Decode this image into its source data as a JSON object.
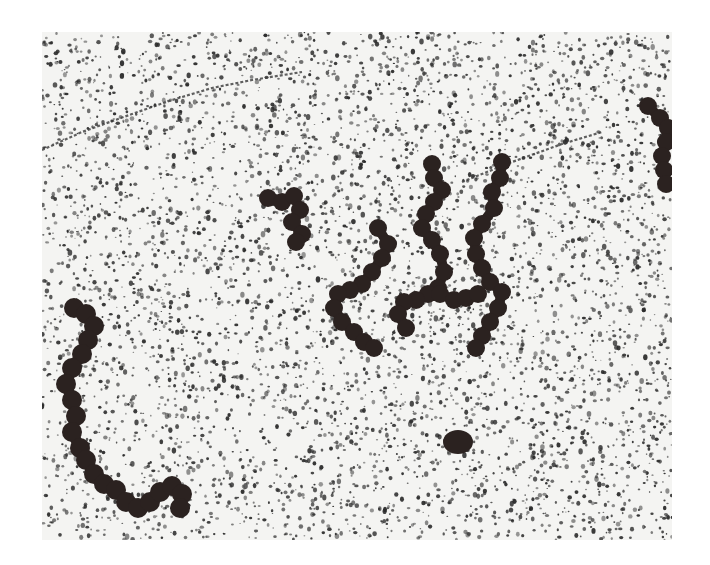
{
  "figure": {
    "kind": "electron micrograph",
    "frame": {
      "x": 42,
      "y": 32,
      "width": 630,
      "height": 508
    },
    "colors": {
      "background": "#f4f4f2",
      "speckle": "#2a2a2a",
      "bead": "#2b2220",
      "fiber": "#3a3a3a"
    },
    "speckle": {
      "count": 5200,
      "seed": 7,
      "min_r": 0.7,
      "max_r": 2.3
    },
    "thin_fibers": [
      [
        [
          0,
          118
        ],
        [
          40,
          100
        ],
        [
          90,
          82
        ],
        [
          130,
          68
        ],
        [
          170,
          56
        ],
        [
          210,
          48
        ],
        [
          260,
          40
        ]
      ],
      [
        [
          420,
          150
        ],
        [
          470,
          130
        ],
        [
          520,
          112
        ],
        [
          560,
          100
        ]
      ]
    ],
    "chains": [
      {
        "name": "chain-upper-left-short",
        "r": 9,
        "beads": [
          [
            226,
            166
          ],
          [
            240,
            170
          ],
          [
            252,
            164
          ],
          [
            258,
            178
          ],
          [
            250,
            190
          ],
          [
            260,
            202
          ],
          [
            254,
            210
          ]
        ]
      },
      {
        "name": "chain-center-left",
        "r": 9,
        "beads": [
          [
            336,
            196
          ],
          [
            346,
            212
          ],
          [
            340,
            226
          ],
          [
            330,
            240
          ],
          [
            320,
            252
          ],
          [
            308,
            258
          ],
          [
            296,
            262
          ],
          [
            292,
            276
          ],
          [
            300,
            290
          ],
          [
            312,
            300
          ],
          [
            322,
            310
          ],
          [
            332,
            316
          ]
        ]
      },
      {
        "name": "chain-center-middle",
        "r": 9,
        "beads": [
          [
            390,
            132
          ],
          [
            392,
            146
          ],
          [
            400,
            158
          ],
          [
            392,
            170
          ],
          [
            384,
            182
          ],
          [
            380,
            196
          ],
          [
            390,
            208
          ],
          [
            398,
            222
          ],
          [
            402,
            240
          ],
          [
            396,
            256
          ],
          [
            386,
            262
          ],
          [
            374,
            268
          ],
          [
            362,
            270
          ],
          [
            356,
            282
          ],
          [
            364,
            296
          ]
        ]
      },
      {
        "name": "chain-center-right",
        "r": 9,
        "beads": [
          [
            460,
            130
          ],
          [
            458,
            146
          ],
          [
            450,
            160
          ],
          [
            452,
            176
          ],
          [
            440,
            192
          ],
          [
            432,
            206
          ],
          [
            434,
            222
          ],
          [
            440,
            236
          ],
          [
            448,
            250
          ],
          [
            460,
            260
          ],
          [
            456,
            276
          ],
          [
            448,
            290
          ],
          [
            440,
            304
          ],
          [
            434,
            316
          ]
        ]
      },
      {
        "name": "chain-center-bottom",
        "r": 9,
        "beads": [
          [
            398,
            262
          ],
          [
            412,
            268
          ],
          [
            424,
            266
          ],
          [
            436,
            262
          ]
        ]
      },
      {
        "name": "chain-lower-left-long",
        "r": 10,
        "beads": [
          [
            32,
            276
          ],
          [
            44,
            282
          ],
          [
            52,
            294
          ],
          [
            46,
            308
          ],
          [
            40,
            322
          ],
          [
            30,
            336
          ],
          [
            24,
            352
          ],
          [
            30,
            368
          ],
          [
            34,
            384
          ],
          [
            30,
            400
          ],
          [
            38,
            416
          ],
          [
            44,
            428
          ],
          [
            52,
            442
          ],
          [
            62,
            452
          ],
          [
            74,
            458
          ],
          [
            84,
            470
          ],
          [
            96,
            476
          ],
          [
            108,
            470
          ],
          [
            118,
            460
          ],
          [
            130,
            454
          ],
          [
            140,
            462
          ],
          [
            138,
            476
          ]
        ]
      },
      {
        "name": "chain-right-edge",
        "r": 9,
        "beads": [
          [
            606,
            74
          ],
          [
            618,
            86
          ],
          [
            626,
            96
          ],
          [
            624,
            110
          ],
          [
            620,
            124
          ],
          [
            622,
            138
          ],
          [
            624,
            152
          ]
        ]
      }
    ],
    "blobs": [
      {
        "name": "isolated-particle",
        "cx": 416,
        "cy": 410,
        "rx": 15,
        "ry": 12
      }
    ]
  }
}
